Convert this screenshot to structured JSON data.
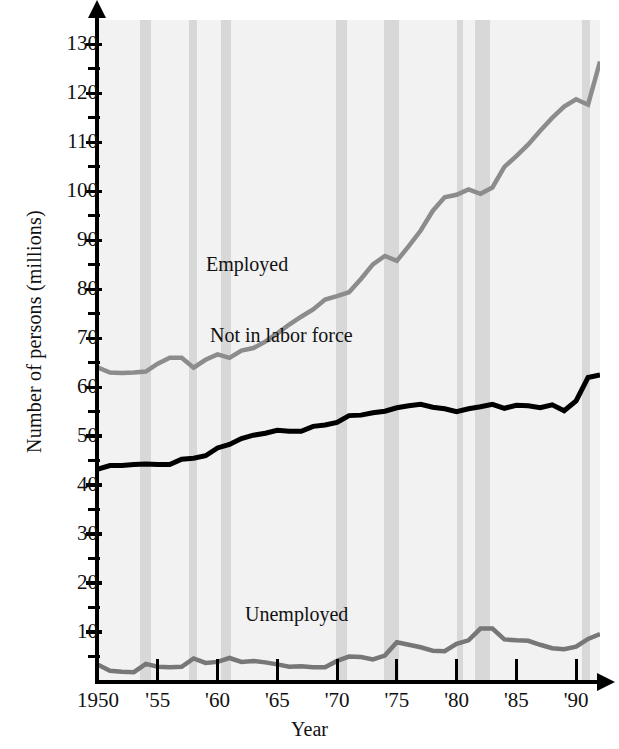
{
  "chart_data": {
    "type": "line",
    "title": "",
    "xlabel": "Year",
    "ylabel": "Number of persons (millions)",
    "xlim": [
      1950,
      1992
    ],
    "ylim": [
      0,
      135
    ],
    "ytick_labels": [
      "10",
      "20",
      "30",
      "40",
      "50",
      "60",
      "70",
      "80",
      "90",
      "100",
      "110",
      "120",
      "130"
    ],
    "ytick_values": [
      10,
      20,
      30,
      40,
      50,
      60,
      70,
      80,
      90,
      100,
      110,
      120,
      130
    ],
    "ytick_minor": [
      5,
      15,
      25,
      35,
      45,
      55,
      65,
      75,
      85,
      95,
      105,
      115,
      125
    ],
    "xtick_labels": [
      "1950",
      "'55",
      "'60",
      "'65",
      "'70",
      "'75",
      "'80",
      "'85",
      "'90"
    ],
    "xtick_values": [
      1950,
      1955,
      1960,
      1965,
      1970,
      1975,
      1980,
      1985,
      1990
    ],
    "grid": false,
    "legend": "inline-annotations",
    "x": [
      1950,
      1951,
      1952,
      1953,
      1954,
      1955,
      1956,
      1957,
      1958,
      1959,
      1960,
      1961,
      1962,
      1963,
      1964,
      1965,
      1966,
      1967,
      1968,
      1969,
      1970,
      1971,
      1972,
      1973,
      1974,
      1975,
      1976,
      1977,
      1978,
      1979,
      1980,
      1981,
      1982,
      1983,
      1984,
      1985,
      1986,
      1987,
      1988,
      1989,
      1990,
      1991,
      1992
    ],
    "series": [
      {
        "name": "Employed",
        "color": "#8c8c8c",
        "values": [
          64.0,
          63.0,
          62.9,
          63.0,
          63.2,
          64.8,
          66.0,
          66.0,
          64.0,
          65.6,
          66.7,
          66.0,
          67.5,
          68.0,
          69.3,
          71.0,
          72.8,
          74.4,
          75.9,
          77.9,
          78.6,
          79.4,
          82.1,
          85.1,
          86.8,
          85.8,
          88.8,
          92.0,
          96.0,
          98.8,
          99.3,
          100.4,
          99.5,
          100.8,
          105.0,
          107.2,
          109.6,
          112.4,
          115.0,
          117.3,
          118.8,
          117.7,
          126.5
        ]
      },
      {
        "name": "Not in labor force",
        "color": "#000000",
        "values": [
          43.3,
          44.0,
          44.0,
          44.2,
          44.3,
          44.2,
          44.2,
          45.3,
          45.5,
          46.0,
          47.6,
          48.3,
          49.5,
          50.2,
          50.6,
          51.2,
          51.0,
          51.0,
          52.0,
          52.3,
          52.8,
          54.2,
          54.3,
          54.8,
          55.1,
          55.8,
          56.2,
          56.5,
          55.9,
          55.6,
          55.0,
          55.6,
          56.0,
          56.5,
          55.7,
          56.3,
          56.2,
          55.8,
          56.4,
          55.2,
          57.2,
          62.0,
          62.5
        ]
      },
      {
        "name": "Unemployed",
        "color": "#777777",
        "values": [
          3.3,
          2.1,
          1.9,
          1.8,
          3.5,
          2.9,
          2.8,
          2.9,
          4.6,
          3.7,
          3.9,
          4.7,
          3.9,
          4.1,
          3.8,
          3.4,
          2.9,
          3.0,
          2.8,
          2.8,
          4.1,
          5.0,
          4.9,
          4.4,
          5.2,
          7.9,
          7.4,
          6.9,
          6.2,
          6.1,
          7.6,
          8.3,
          10.7,
          10.7,
          8.5,
          8.3,
          8.2,
          7.4,
          6.7,
          6.5,
          7.0,
          8.6,
          9.6
        ]
      }
    ],
    "recession_bands": [
      {
        "start": 1953.5,
        "end": 1954.4
      },
      {
        "start": 1957.6,
        "end": 1958.3
      },
      {
        "start": 1960.3,
        "end": 1961.1
      },
      {
        "start": 1969.9,
        "end": 1970.8
      },
      {
        "start": 1973.9,
        "end": 1975.2
      },
      {
        "start": 1980.0,
        "end": 1980.5
      },
      {
        "start": 1981.5,
        "end": 1982.8
      },
      {
        "start": 1990.5,
        "end": 1991.2
      }
    ]
  },
  "annotations": {
    "employed": "Employed",
    "not_in_labor_force": "Not in labor force",
    "unemployed": "Unemployed"
  },
  "axes": {
    "x_title": "Year",
    "y_title": "Number of persons (millions)"
  },
  "colors": {
    "plot_background": "#f2f2f2",
    "recession_band": "#d4d4d4",
    "employed_line": "#8c8c8c",
    "not_in_labor_force_line": "#000000",
    "unemployed_line": "#777777",
    "axis": "#000000"
  }
}
